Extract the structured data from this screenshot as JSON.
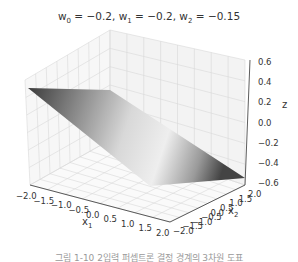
{
  "chart_data": {
    "type": "surface3d",
    "title_parts": {
      "w0_label": "w",
      "w0_sub": "0",
      "w0_val": " = −0.2, ",
      "w1_label": "w",
      "w1_sub": "1",
      "w1_val": " = −0.2, ",
      "w2_label": "w",
      "w2_sub": "2",
      "w2_val": " = −0.15"
    },
    "weights": {
      "w0": -0.2,
      "w1": -0.2,
      "w2": -0.15
    },
    "xlabel": "x₁",
    "ylabel": "x₂",
    "zlabel": "z",
    "x_ticks": [
      "−2.0",
      "−1.5",
      "−1.0",
      "−0.5",
      "0.0",
      "0.5",
      "1.0",
      "1.5",
      "2.0"
    ],
    "y_ticks": [
      "−2.0",
      "−1.5",
      "−1.0",
      "−0.5",
      "0.0",
      "0.5",
      "1.0",
      "1.5",
      "2.0"
    ],
    "z_ticks": [
      "0.6",
      "0.4",
      "0.2",
      "0.0",
      "−0.2",
      "−0.4",
      "−0.6"
    ],
    "xlim": [
      -2.0,
      2.0
    ],
    "ylim": [
      -2.0,
      2.0
    ],
    "zlim": [
      -0.6,
      0.6
    ],
    "grid": true,
    "colormap": "gray",
    "surface": "z = w0 + w1*x1 + w2*x2 (decision boundary plane)"
  },
  "caption": "그림 1-10  2입력 퍼셉트론 결정 경계의 3차원 도표",
  "labels": {
    "x1_main": "x",
    "x1_sub": "1",
    "x2_main": "x",
    "x2_sub": "2",
    "z": "z"
  }
}
